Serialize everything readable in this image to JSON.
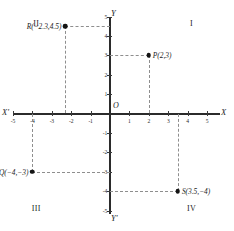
{
  "chart_data": {
    "type": "scatter",
    "title": "",
    "xlabel": "X",
    "ylabel": "Y",
    "xlim": [
      -5.5,
      5.5
    ],
    "ylim": [
      -5.5,
      5.5
    ],
    "grid": false,
    "legend": "none",
    "x_ticks": [
      -5,
      -4,
      -3,
      -2,
      -1,
      1,
      2,
      3,
      4,
      5
    ],
    "y_ticks": [
      5,
      4,
      3,
      2,
      1,
      -1,
      -2,
      -3,
      -4,
      -5
    ],
    "x_tick_labels": [
      "-5",
      "-4",
      "-3",
      "-2",
      "-1",
      "1",
      "2",
      "3",
      "4",
      "5"
    ],
    "y_tick_labels": [
      "5",
      "4",
      "3",
      "2",
      "1",
      "-1",
      "-2",
      "-3",
      "-4",
      "-5"
    ],
    "points": [
      {
        "name": "P",
        "label": "P(2,3)",
        "x": 2,
        "y": 3,
        "label_side": "right"
      },
      {
        "name": "R",
        "label": "R(−2.3,4.5)",
        "x": -2.3,
        "y": 4.5,
        "label_side": "left"
      },
      {
        "name": "Q",
        "label": "Q(−4,−3)",
        "x": -4,
        "y": -3,
        "label_side": "left"
      },
      {
        "name": "S",
        "label": "S(3.5,−4)",
        "x": 3.5,
        "y": -4,
        "label_side": "right"
      }
    ],
    "annotations": {
      "origin": "O",
      "axis_x_positive": "X",
      "axis_x_negative": "X'",
      "axis_y_positive": "Y",
      "axis_y_negative": "Y'",
      "quadrants": [
        {
          "name": "I",
          "label": "I",
          "x": 4.2,
          "y": 4.6
        },
        {
          "name": "II",
          "label": "II",
          "x": -3.8,
          "y": 4.6
        },
        {
          "name": "III",
          "label": "III",
          "x": -3.8,
          "y": -4.9
        },
        {
          "name": "IV",
          "label": "IV",
          "x": 4.2,
          "y": -4.9
        }
      ]
    },
    "colors": {
      "axis": "#2b2b2b",
      "guide": "#8e8e8e",
      "point": "#141414",
      "text": "#1c1c1c",
      "background": "#ffffff"
    }
  }
}
